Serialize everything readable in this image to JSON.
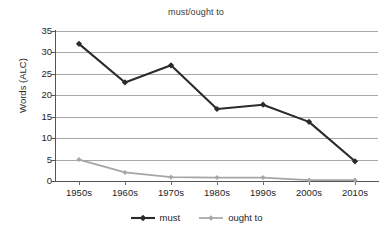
{
  "chart_data": {
    "type": "line",
    "title": "must/ought to",
    "xlabel": "",
    "ylabel": "Words (ALC)",
    "categories": [
      "1950s",
      "1960s",
      "1970s",
      "1980s",
      "1990s",
      "2000s",
      "2010s"
    ],
    "yticks": [
      0,
      5,
      10,
      15,
      20,
      25,
      30,
      35
    ],
    "ylim": [
      0,
      35
    ],
    "grid": true,
    "legend_position": "bottom",
    "series": [
      {
        "name": "must",
        "color": "#2b2b2b",
        "marker": "diamond",
        "values": [
          32.0,
          23.0,
          27.0,
          16.8,
          17.8,
          13.8,
          4.6
        ]
      },
      {
        "name": "ought to",
        "color": "#a6a6a6",
        "marker": "diamond",
        "values": [
          5.0,
          2.0,
          0.9,
          0.8,
          0.8,
          0.2,
          0.2
        ]
      }
    ]
  }
}
